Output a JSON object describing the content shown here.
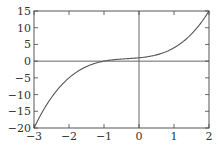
{
  "chart_data": {
    "type": "line",
    "title": "",
    "xlabel": "",
    "ylabel": "",
    "function": "x^3 + x^2 + x + 1",
    "xlim": [
      -3,
      2
    ],
    "ylim": [
      -20,
      15
    ],
    "grid": false,
    "legend": null,
    "x_ticks": [
      -3,
      -2,
      -1,
      0,
      1,
      2
    ],
    "x_tick_labels": [
      "−3",
      "−2",
      "−1",
      "0",
      "1",
      "2"
    ],
    "y_ticks": [
      -20,
      -15,
      -10,
      -5,
      0,
      5,
      10,
      15
    ],
    "y_tick_labels": [
      "−20",
      "−15",
      "−10",
      "−5",
      "0",
      "5",
      "10",
      "15"
    ],
    "axis_lines": {
      "x_zero": true,
      "y_zero": true
    },
    "series": [
      {
        "name": "f(x)",
        "color": "#555555",
        "x": [
          -3,
          -2.5,
          -2,
          -1.5,
          -1,
          -0.5,
          0,
          0.5,
          1,
          1.5,
          2
        ],
        "y": [
          -20,
          -10.875,
          -5,
          -1.625,
          0,
          0.625,
          1,
          1.875,
          4,
          8.125,
          15
        ]
      }
    ]
  }
}
